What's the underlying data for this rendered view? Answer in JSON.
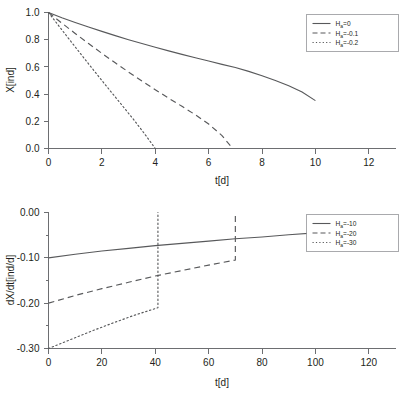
{
  "figure": {
    "panels": [
      "top",
      "bottom"
    ]
  },
  "chart_data": [
    {
      "id": "top",
      "type": "line",
      "title": "",
      "xlabel": "t[d]",
      "ylabel": "X[ind]",
      "xlim": [
        0,
        13
      ],
      "ylim": [
        0,
        1.0
      ],
      "grid": false,
      "legend_position": "top-right",
      "xticks": [
        0,
        2,
        4,
        6,
        8,
        10,
        12
      ],
      "xticklabels": [
        "0",
        "2",
        "4",
        "6",
        "8",
        "10",
        "12"
      ],
      "yticks": [
        0.0,
        0.2,
        0.4,
        0.6,
        0.8,
        1.0
      ],
      "yticklabels": [
        "0.0",
        "0.2",
        "0.4",
        "0.6",
        "0.8",
        "1.0"
      ],
      "series": [
        {
          "name": "H_a = 0",
          "legend_main": "H",
          "legend_subscript": "a",
          "legend_value": "=0",
          "style": "solid",
          "x": [
            0,
            0.5,
            1,
            1.5,
            2,
            2.5,
            3,
            3.5,
            4,
            4.5,
            5,
            5.5,
            6,
            6.5,
            7,
            7.5,
            8,
            8.5,
            9,
            9.5,
            10
          ],
          "y": [
            1.0,
            0.962,
            0.927,
            0.893,
            0.861,
            0.83,
            0.8,
            0.772,
            0.744,
            0.718,
            0.692,
            0.667,
            0.643,
            0.619,
            0.596,
            0.567,
            0.535,
            0.5,
            0.462,
            0.415,
            0.352
          ]
        },
        {
          "name": "H_a = -0.1",
          "legend_main": "H",
          "legend_subscript": "a",
          "legend_value": "=-0.1",
          "style": "dashed",
          "x": [
            0,
            0.5,
            1,
            1.5,
            2,
            2.5,
            3,
            3.5,
            4,
            4.5,
            5,
            5.5,
            6,
            6.5,
            6.9
          ],
          "y": [
            1.0,
            0.922,
            0.846,
            0.772,
            0.7,
            0.63,
            0.562,
            0.496,
            0.432,
            0.37,
            0.31,
            0.248,
            0.18,
            0.095,
            0.0
          ]
        },
        {
          "name": "H_a = -0.2",
          "legend_main": "H",
          "legend_subscript": "a",
          "legend_value": "=-0.2",
          "style": "dotted",
          "x": [
            0,
            0.4,
            0.8,
            1.2,
            1.6,
            2.0,
            2.4,
            2.8,
            3.2,
            3.6,
            4.0
          ],
          "y": [
            1.0,
            0.898,
            0.797,
            0.697,
            0.598,
            0.5,
            0.403,
            0.307,
            0.21,
            0.108,
            0.0
          ]
        }
      ]
    },
    {
      "id": "bottom",
      "type": "line",
      "title": "",
      "xlabel": "t[d]",
      "ylabel": "dX/dt[ind/d]",
      "xlim": [
        0,
        130
      ],
      "ylim": [
        -0.3,
        0.0
      ],
      "grid": false,
      "legend_position": "top-right",
      "xticks": [
        0,
        20,
        40,
        60,
        80,
        100,
        120
      ],
      "xticklabels": [
        "0",
        "20",
        "40",
        "60",
        "80",
        "100",
        "120"
      ],
      "yticks": [
        -0.3,
        -0.25,
        -0.2,
        -0.15,
        -0.1,
        -0.05,
        0.0
      ],
      "ymajorticks": [
        -0.3,
        -0.2,
        -0.1,
        0.0
      ],
      "yticklabels": [
        "-0.30",
        "-0.20",
        "-0.10",
        "0.00"
      ],
      "series": [
        {
          "name": "H_a = -10",
          "legend_main": "H",
          "legend_subscript": "a",
          "legend_value": "=-10",
          "style": "solid",
          "x": [
            0,
            10,
            20,
            30,
            40,
            50,
            60,
            70,
            80,
            90,
            100
          ],
          "y": [
            -0.1,
            -0.092,
            -0.085,
            -0.079,
            -0.073,
            -0.068,
            -0.063,
            -0.058,
            -0.054,
            -0.049,
            -0.045
          ]
        },
        {
          "name": "H_a = -20",
          "legend_main": "H",
          "legend_subscript": "a",
          "legend_value": "=-20",
          "style": "dashed",
          "x": [
            0,
            10,
            20,
            30,
            40,
            50,
            60,
            70
          ],
          "y": [
            -0.2,
            -0.183,
            -0.168,
            -0.154,
            -0.14,
            -0.128,
            -0.116,
            -0.105
          ],
          "jump_x": 70,
          "jump_from": -0.105,
          "jump_to": 0.0
        },
        {
          "name": "H_a = -30",
          "legend_main": "H",
          "legend_subscript": "a",
          "legend_value": "=-30",
          "style": "dotted",
          "x": [
            0,
            8,
            16,
            24,
            32,
            41
          ],
          "y": [
            -0.3,
            -0.281,
            -0.262,
            -0.244,
            -0.227,
            -0.21
          ],
          "jump_x": 41,
          "jump_from": -0.21,
          "jump_to": 0.0
        }
      ]
    }
  ]
}
